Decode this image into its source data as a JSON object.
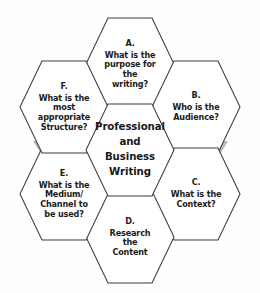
{
  "diagram": {
    "type": "hexagonal-honeycomb-process",
    "title_center": "Professional\nand\nBusiness\nWriting",
    "background_color": "#fefefe",
    "hex_fill_color": "#ffffff",
    "hex_stroke_color": "#3b3b3b",
    "connector_color": "#b8b8b8",
    "text_color": "#1a1a1a",
    "center": {
      "name": "center-hexagon",
      "text": "Professional\nand\nBusiness\nWriting"
    },
    "nodes": [
      {
        "id": "A",
        "name": "hexagon-a",
        "tag": "A.",
        "text": "What is the\npurpose for\nthe\nwriting?",
        "position": "top"
      },
      {
        "id": "B",
        "name": "hexagon-b",
        "tag": "B.",
        "text": "Who is the\nAudience?",
        "position": "top-right"
      },
      {
        "id": "C",
        "name": "hexagon-c",
        "tag": "C.",
        "text": "What is the\nContext?",
        "position": "bottom-right"
      },
      {
        "id": "D",
        "name": "hexagon-d",
        "tag": "D.",
        "text": "Research\nthe\nContent",
        "position": "bottom"
      },
      {
        "id": "E",
        "name": "hexagon-e",
        "tag": "E.",
        "text": "What is the\nMedium/\nChannel to\nbe used?",
        "position": "bottom-left"
      },
      {
        "id": "F",
        "name": "hexagon-f",
        "tag": "F.",
        "text": "What is the\nmost\nappropriate\nStructure?",
        "position": "top-left"
      }
    ],
    "connectors": [
      {
        "name": "connector-a-to-b",
        "from": "A",
        "to": "B"
      },
      {
        "name": "connector-b-to-c",
        "from": "B",
        "to": "C"
      },
      {
        "name": "connector-c-to-d",
        "from": "C",
        "to": "D"
      },
      {
        "name": "connector-d-to-e",
        "from": "D",
        "to": "E"
      },
      {
        "name": "connector-e-to-f",
        "from": "E",
        "to": "F"
      }
    ]
  }
}
